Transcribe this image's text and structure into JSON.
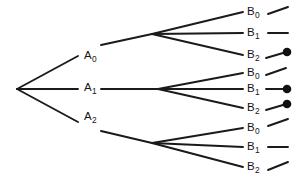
{
  "diagram": {
    "type": "tree",
    "background_color": "#ffffff",
    "line_color": "#1a1a1a",
    "dot_color": "#111111",
    "root": {
      "name": "root-node",
      "x": 17,
      "y": 89
    },
    "level1": [
      {
        "id": "a0",
        "label_text": "A",
        "label_sub": "0",
        "label_x": 84,
        "label_y": 50,
        "node_x": 152,
        "node_y": 34,
        "line_break_start_x": 78,
        "line_break_end_x": 101
      },
      {
        "id": "a1",
        "label_text": "A",
        "label_sub": "1",
        "label_x": 84,
        "label_y": 82,
        "node_x": 158,
        "node_y": 89,
        "line_break_start_x": 78,
        "line_break_end_x": 101
      },
      {
        "id": "a2",
        "label_text": "A",
        "label_sub": "2",
        "label_x": 84,
        "label_y": 111,
        "node_x": 152,
        "node_y": 143,
        "line_break_start_x": 78,
        "line_break_end_x": 101
      }
    ],
    "level2": [
      {
        "parent": "a0",
        "leaves": [
          {
            "id": "a0b0",
            "label_text": "B",
            "label_sub": "0",
            "label_x": 247,
            "label_y": 6,
            "tip_x": 243,
            "tip_y": 12,
            "stub_x1": 268,
            "stub_y1": 14,
            "stub_x2": 288,
            "stub_y2": 7,
            "dot": false,
            "dot_x": 0,
            "dot_y": 0
          },
          {
            "id": "a0b1",
            "label_text": "B",
            "label_sub": "1",
            "label_x": 247,
            "label_y": 27,
            "tip_x": 243,
            "tip_y": 33,
            "stub_x1": 268,
            "stub_y1": 33,
            "stub_x2": 288,
            "stub_y2": 33,
            "dot": false,
            "dot_x": 0,
            "dot_y": 0
          },
          {
            "id": "a0b2",
            "label_text": "B",
            "label_sub": "2",
            "label_x": 247,
            "label_y": 49,
            "tip_x": 243,
            "tip_y": 55,
            "stub_x1": 266,
            "stub_y1": 58,
            "stub_x2": 283,
            "stub_y2": 53,
            "dot": true,
            "dot_x": 287,
            "dot_y": 52
          }
        ]
      },
      {
        "parent": "a1",
        "leaves": [
          {
            "id": "a1b0",
            "label_text": "B",
            "label_sub": "0",
            "label_x": 247,
            "label_y": 67,
            "tip_x": 243,
            "tip_y": 73,
            "stub_x1": 266,
            "stub_y1": 75,
            "stub_x2": 286,
            "stub_y2": 68,
            "dot": false,
            "dot_x": 0,
            "dot_y": 0
          },
          {
            "id": "a1b1",
            "label_text": "B",
            "label_sub": "1",
            "label_x": 247,
            "label_y": 83,
            "tip_x": 243,
            "tip_y": 89,
            "stub_x1": 266,
            "stub_y1": 89,
            "stub_x2": 283,
            "stub_y2": 89,
            "dot": true,
            "dot_x": 287,
            "dot_y": 89
          },
          {
            "id": "a1b2",
            "label_text": "B",
            "label_sub": "2",
            "label_x": 247,
            "label_y": 102,
            "tip_x": 243,
            "tip_y": 108,
            "stub_x1": 266,
            "stub_y1": 110,
            "stub_x2": 283,
            "stub_y2": 105,
            "dot": true,
            "dot_x": 287,
            "dot_y": 104
          }
        ]
      },
      {
        "parent": "a2",
        "leaves": [
          {
            "id": "a2b0",
            "label_text": "B",
            "label_sub": "0",
            "label_x": 247,
            "label_y": 122,
            "tip_x": 243,
            "tip_y": 128,
            "stub_x1": 268,
            "stub_y1": 126,
            "stub_x2": 288,
            "stub_y2": 119,
            "dot": false,
            "dot_x": 0,
            "dot_y": 0
          },
          {
            "id": "a2b1",
            "label_text": "B",
            "label_sub": "1",
            "label_x": 247,
            "label_y": 141,
            "tip_x": 243,
            "tip_y": 147,
            "stub_x1": 268,
            "stub_y1": 147,
            "stub_x2": 288,
            "stub_y2": 147,
            "dot": false,
            "dot_x": 0,
            "dot_y": 0
          },
          {
            "id": "a2b2",
            "label_text": "B",
            "label_sub": "2",
            "label_x": 247,
            "label_y": 161,
            "tip_x": 243,
            "tip_y": 167,
            "stub_x1": 268,
            "stub_y1": 170,
            "stub_x2": 288,
            "stub_y2": 162,
            "dot": false,
            "dot_x": 0,
            "dot_y": 0
          }
        ]
      }
    ]
  }
}
